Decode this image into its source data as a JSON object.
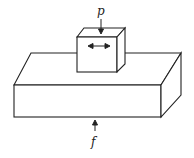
{
  "diagram": {
    "labels": {
      "top_force": "p",
      "bottom_force": "f"
    },
    "stroke_color": "#222222",
    "background": "#ffffff"
  }
}
